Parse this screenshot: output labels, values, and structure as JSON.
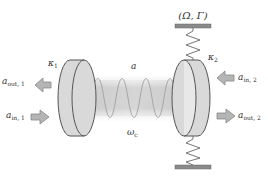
{
  "diagram": {
    "type": "optomechanical-cavity",
    "labels": {
      "mechanical_params": "(Ω, Γ)",
      "kappa1": "κ",
      "kappa1_sub": "1",
      "kappa2": "κ",
      "kappa2_sub": "2",
      "cavity_mode": "a",
      "cavity_freq": "ω",
      "cavity_freq_sub": "c",
      "a_out_1": "a",
      "a_out_1_sub": "out, 1",
      "a_in_1": "a",
      "a_in_1_sub": "in, 1",
      "a_in_2": "a",
      "a_in_2_sub": "in, 2",
      "a_out_2": "a",
      "a_out_2_sub": "out, 2"
    },
    "components": [
      {
        "name": "left-mirror",
        "role": "fixed mirror with loss rate κ1"
      },
      {
        "name": "right-mirror",
        "role": "movable mirror with loss rate κ2, spring-coupled"
      },
      {
        "name": "top-spring",
        "role": "mechanical support"
      },
      {
        "name": "bottom-spring",
        "role": "mechanical support"
      },
      {
        "name": "cavity-field",
        "role": "intracavity standing wave"
      }
    ],
    "colors": {
      "mirror_fill": "#d9d9d9",
      "mirror_stroke": "#555555",
      "arrow_fill": "#b5b5b5",
      "arrow_stroke": "#888888",
      "bar_fill": "#8a8a8a",
      "field_fill": "#cccccc",
      "spring_stroke": "#666666"
    }
  }
}
